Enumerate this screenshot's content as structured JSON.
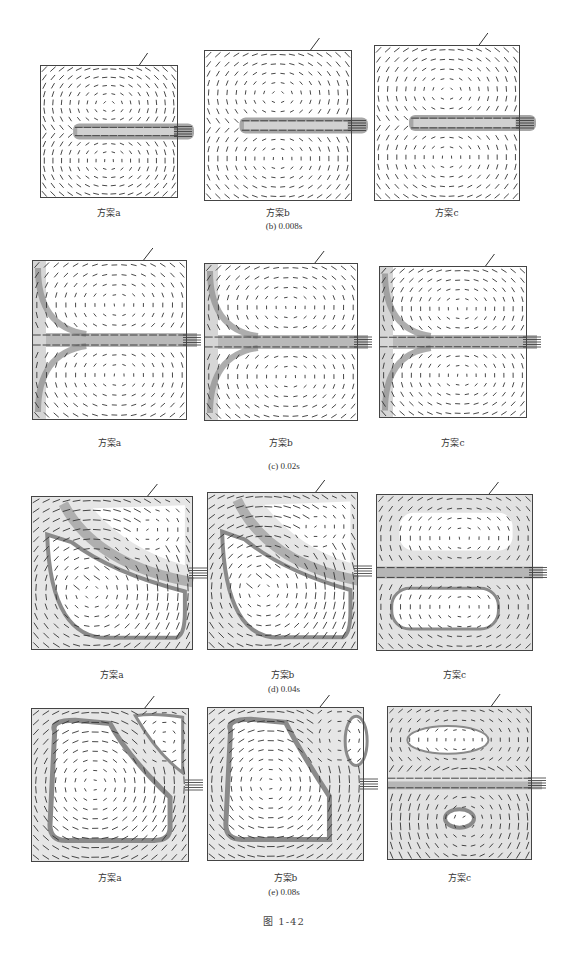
{
  "figure": {
    "label": "图 1-42",
    "rows": [
      {
        "subtitle": "(b) 0.008s",
        "panels": [
          {
            "caption": "方案a",
            "box": [
              40,
              65,
              138,
              133
            ],
            "pattern": "jet-early",
            "jet_start": 0.22
          },
          {
            "caption": "方案b",
            "box": [
              204,
              50,
              148,
              151
            ],
            "pattern": "jet-early",
            "jet_start": 0.25
          },
          {
            "caption": "方案c",
            "box": [
              374,
              45,
              146,
              156
            ],
            "pattern": "jet-early",
            "jet_start": 0.25
          }
        ]
      },
      {
        "subtitle": "(c) 0.02s",
        "panels": [
          {
            "caption": "方案a",
            "box": [
              32,
              260,
              155,
              160
            ],
            "pattern": "two-vortex"
          },
          {
            "caption": "方案b",
            "box": [
              204,
              263,
              154,
              158
            ],
            "pattern": "two-vortex"
          },
          {
            "caption": "方案c",
            "box": [
              379,
              266,
              148,
              152
            ],
            "pattern": "two-vortex"
          }
        ]
      },
      {
        "subtitle": "(d) 0.04s",
        "panels": [
          {
            "caption": "方案a",
            "box": [
              31,
              496,
              162,
              154
            ],
            "pattern": "diagonal"
          },
          {
            "caption": "方案b",
            "box": [
              207,
              492,
              151,
              158
            ],
            "pattern": "diagonal"
          },
          {
            "caption": "方案c",
            "box": [
              376,
              494,
              157,
              157
            ],
            "pattern": "two-vortex-late"
          }
        ]
      },
      {
        "subtitle": "(e) 0.08s",
        "panels": [
          {
            "caption": "方案a",
            "box": [
              31,
              708,
              158,
              154
            ],
            "pattern": "big-vortex"
          },
          {
            "caption": "方案b",
            "box": [
              207,
              707,
              157,
              154
            ],
            "pattern": "big-vortex-b"
          },
          {
            "caption": "方案c",
            "box": [
              387,
              706,
              145,
              154
            ],
            "pattern": "mixed"
          }
        ]
      }
    ]
  },
  "layout": {
    "caption_y": [
      212,
      442,
      674,
      877
    ],
    "subtitle_y": [
      227,
      467,
      690,
      893
    ],
    "figlabel_y": 920
  },
  "colors": {
    "ink": "#333333",
    "shade_dark": "#8a8a8a",
    "shade_light": "#d6d6d6",
    "background": "#ffffff"
  }
}
